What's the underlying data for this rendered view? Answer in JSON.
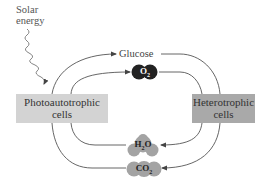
{
  "diagram": {
    "energy_source": {
      "line1": "Solar",
      "line2": "energy"
    },
    "nodes": {
      "photoautotrophic": {
        "line1": "Photoautotrophic",
        "line2": "cells",
        "color": "#d3d3d3"
      },
      "heterotrophic": {
        "line1": "Heterotrophic",
        "line2": "cells",
        "color": "#a9a9a9"
      }
    },
    "products_from_photoautotrophs": [
      {
        "label": "Glucose",
        "style": "text"
      },
      {
        "label": "O",
        "subscript": "2",
        "style": "dark-blob",
        "color": "#222222"
      }
    ],
    "products_from_heterotrophs": [
      {
        "label": "H",
        "subscript": "2",
        "label_suffix": "O",
        "style": "gray-blob",
        "color": "#a0a0a0"
      },
      {
        "label": "CO",
        "subscript": "2",
        "style": "gray-blob",
        "color": "#a0a0a0"
      }
    ],
    "colors": {
      "line": "#555555",
      "background": "#ffffff"
    }
  }
}
